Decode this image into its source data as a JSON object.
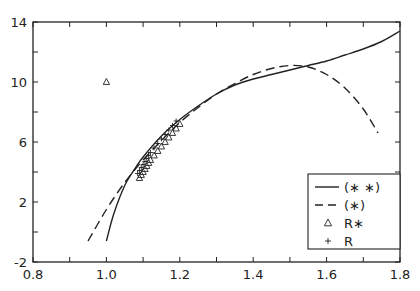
{
  "chart_data": {
    "type": "line",
    "title": "",
    "xlabel": "",
    "ylabel": "",
    "xlim": [
      0.8,
      1.8
    ],
    "ylim": [
      -2,
      14
    ],
    "x_ticks": [
      "0.8",
      "1.0",
      "1.2",
      "1.4",
      "1.6",
      "1.8"
    ],
    "y_ticks": [
      "-2",
      "2",
      "6",
      "10",
      "14"
    ],
    "grid": false,
    "legend_position": "lower right",
    "legend": [
      {
        "label": "(∗ ∗)",
        "style": "solid line"
      },
      {
        "label": "(∗)",
        "style": "dashed line"
      },
      {
        "label": "R∗",
        "style": "triangle marker"
      },
      {
        "label": "R",
        "style": "plus marker"
      }
    ],
    "series": [
      {
        "name": "(∗ ∗)",
        "style": "solid",
        "x": [
          1.0,
          1.02,
          1.05,
          1.08,
          1.1,
          1.15,
          1.2,
          1.25,
          1.3,
          1.35,
          1.4,
          1.45,
          1.5,
          1.55,
          1.6,
          1.65,
          1.7,
          1.75,
          1.8
        ],
        "y": [
          -0.6,
          1.2,
          3.1,
          4.3,
          5.0,
          6.4,
          7.5,
          8.4,
          9.2,
          9.8,
          10.2,
          10.5,
          10.8,
          11.1,
          11.4,
          11.8,
          12.2,
          12.7,
          13.4
        ]
      },
      {
        "name": "(∗)",
        "style": "dashed",
        "x": [
          0.95,
          1.0,
          1.05,
          1.1,
          1.15,
          1.2,
          1.25,
          1.3,
          1.35,
          1.4,
          1.45,
          1.5,
          1.55,
          1.6,
          1.65,
          1.7,
          1.74
        ],
        "y": [
          -0.6,
          1.5,
          3.3,
          4.8,
          6.1,
          7.3,
          8.3,
          9.2,
          9.9,
          10.5,
          10.9,
          11.1,
          11.0,
          10.5,
          9.6,
          8.2,
          6.6
        ]
      },
      {
        "name": "R∗",
        "style": "triangle",
        "x": [
          1.0,
          1.09,
          1.095,
          1.1,
          1.105,
          1.11,
          1.115,
          1.12,
          1.13,
          1.14,
          1.15,
          1.16,
          1.17,
          1.18,
          1.19,
          1.2
        ],
        "y": [
          10.0,
          3.6,
          3.8,
          4.0,
          4.2,
          4.4,
          4.6,
          4.8,
          5.1,
          5.4,
          5.7,
          6.0,
          6.3,
          6.6,
          6.9,
          7.2
        ]
      },
      {
        "name": "R",
        "style": "plus",
        "x": [
          1.085,
          1.09,
          1.095,
          1.1,
          1.105,
          1.11,
          1.115,
          1.12,
          1.13,
          1.14,
          1.15,
          1.16,
          1.17,
          1.18,
          1.19
        ],
        "y": [
          3.9,
          4.1,
          4.3,
          4.5,
          4.7,
          4.9,
          5.1,
          5.3,
          5.6,
          5.9,
          6.2,
          6.5,
          6.8,
          7.1,
          7.4
        ]
      }
    ]
  }
}
